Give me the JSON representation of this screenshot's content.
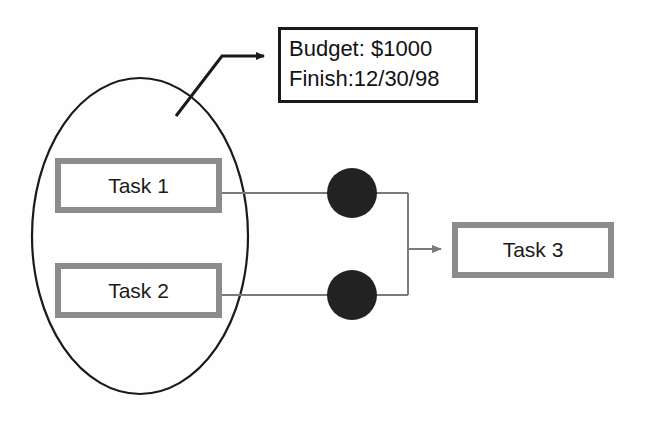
{
  "diagram": {
    "group": {
      "name": "grouping-ellipse",
      "shape": "ellipse",
      "center_x": 140,
      "center_y": 236,
      "radius_x": 108,
      "radius_y": 158,
      "stroke": "#1a1a1a",
      "stroke_width": 2.2,
      "fill": "none"
    },
    "annotation": {
      "name": "annotation-callout",
      "box": {
        "x": 278,
        "y": 27,
        "width": 200,
        "height": 76
      },
      "border_color": "#1a1a1a",
      "border_width": 3,
      "fill": "#ffffff",
      "lines": [
        "Budget: $1000",
        "Finish:12/30/98"
      ],
      "pointer": {
        "name": "annotation-pointer-arrow",
        "path": "M 176,116 L 222,56 L 262,56",
        "arrow_tip_x": 272,
        "arrow_tip_y": 56,
        "stroke": "#1a1a1a",
        "stroke_width": 3
      }
    },
    "nodes": [
      {
        "id": "task-1",
        "label": "Task 1",
        "x": 55,
        "y": 158,
        "width": 167,
        "height": 55,
        "border_color": "#8c8c8c",
        "border_width": 6,
        "fill": "#ffffff"
      },
      {
        "id": "task-2",
        "label": "Task 2",
        "x": 55,
        "y": 263,
        "width": 167,
        "height": 55,
        "border_color": "#8c8c8c",
        "border_width": 6,
        "fill": "#ffffff"
      },
      {
        "id": "task-3",
        "label": "Task 3",
        "x": 452,
        "y": 222,
        "width": 162,
        "height": 56,
        "border_color": "#8c8c8c",
        "border_width": 6,
        "fill": "#ffffff"
      }
    ],
    "junction_dots": [
      {
        "id": "dot-top",
        "name": "milestone-dot-task-1",
        "cx": 352,
        "cy": 193,
        "r": 25,
        "fill": "#222222"
      },
      {
        "id": "dot-bottom",
        "name": "milestone-dot-task-2",
        "cx": 352,
        "cy": 295,
        "r": 25,
        "fill": "#222222"
      }
    ],
    "connectors": [
      {
        "id": "edge-task1-dot",
        "name": "connector-task1-to-dot",
        "from": "task-1",
        "to": "dot-top",
        "path": "M 222,193 L 408,193",
        "stroke": "#7a7a7a",
        "stroke_width": 2,
        "arrow": false
      },
      {
        "id": "edge-task2-dot",
        "name": "connector-task2-to-dot",
        "from": "task-2",
        "to": "dot-bottom",
        "path": "M 222,295 L 408,295",
        "stroke": "#7a7a7a",
        "stroke_width": 2,
        "arrow": false
      },
      {
        "id": "edge-merge-bus",
        "name": "connector-merge-bus",
        "path": "M 408,193 L 408,295",
        "stroke": "#7a7a7a",
        "stroke_width": 2,
        "arrow": false
      },
      {
        "id": "edge-merge-task3",
        "name": "connector-merge-to-task3",
        "from": "merge",
        "to": "task-3",
        "path": "M 408,249 L 440,249",
        "stroke": "#7a7a7a",
        "stroke_width": 2,
        "arrow": true,
        "arrow_tip_x": 450,
        "arrow_tip_y": 249
      }
    ]
  },
  "colors": {
    "background": "#fefefe",
    "box_border": "#8c8c8c",
    "outline": "#1a1a1a",
    "connector": "#7a7a7a",
    "dot_fill": "#222222",
    "text": "#1b1b1b"
  }
}
